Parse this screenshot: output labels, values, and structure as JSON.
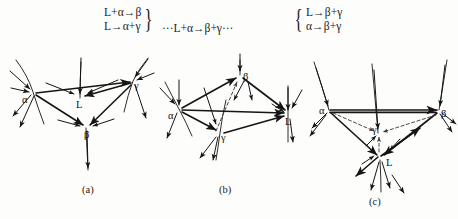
{
  "figure": {
    "caption_a": "(a)",
    "caption_b": "(b)",
    "caption_c": "(c)"
  },
  "equations": {
    "left_group": {
      "line1": "L+α→β",
      "line2": "L→α+γ",
      "brace": "}"
    },
    "middle": "···L+α→β+γ···",
    "right_group": {
      "brace": "{",
      "line1": "L→β+γ",
      "line2": "α→β+γ"
    }
  },
  "diagram_a": {
    "name": "diagram-a",
    "nodes": [
      {
        "id": "alpha",
        "label": "α",
        "x": 33,
        "y": 92
      },
      {
        "id": "L",
        "label": "L",
        "x": 80,
        "y": 98
      },
      {
        "id": "gamma",
        "label": "γ",
        "x": 133,
        "y": 81
      },
      {
        "id": "beta",
        "label": "β",
        "x": 86,
        "y": 128
      }
    ]
  },
  "diagram_b": {
    "name": "diagram-b",
    "nodes": [
      {
        "id": "beta",
        "label": "β",
        "x": 240,
        "y": 75
      },
      {
        "id": "alpha",
        "label": "α",
        "x": 179,
        "y": 109
      },
      {
        "id": "L",
        "label": "L",
        "x": 288,
        "y": 114
      },
      {
        "id": "gamma",
        "label": "γ",
        "x": 220,
        "y": 133
      }
    ]
  },
  "diagram_c": {
    "name": "diagram-c",
    "nodes": [
      {
        "id": "alpha",
        "label": "α",
        "x": 329,
        "y": 110
      },
      {
        "id": "beta",
        "label": "β",
        "x": 439,
        "y": 110
      },
      {
        "id": "gamma",
        "label": "γ",
        "x": 378,
        "y": 133
      },
      {
        "id": "L",
        "label": "L",
        "x": 380,
        "y": 158
      }
    ]
  },
  "colors": {
    "ink": "#151515",
    "paper": "#fdfdfb",
    "dashed": "#4a4a4a"
  }
}
